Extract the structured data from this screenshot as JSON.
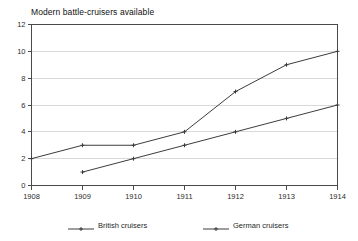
{
  "chart_data": {
    "type": "line",
    "title": "Modern battle-cruisers available",
    "xlabel": "",
    "ylabel": "",
    "x": [
      1908,
      1909,
      1910,
      1911,
      1912,
      1913,
      1914
    ],
    "xtick_labels": [
      "1908",
      "1909",
      "1910",
      "1911",
      "1912",
      "1913",
      "1914"
    ],
    "ytick_labels": [
      "0",
      "2",
      "4",
      "6",
      "8",
      "10",
      "12"
    ],
    "yticks": [
      0,
      2,
      4,
      6,
      8,
      10,
      12
    ],
    "xlim": [
      1908,
      1914
    ],
    "ylim": [
      0,
      12
    ],
    "grid": "horizontal",
    "legend_position": "bottom",
    "series": [
      {
        "name": "British cruisers",
        "color": "#3c3c3c",
        "marker": "plus",
        "x": [
          1908,
          1909,
          1910,
          1911,
          1912,
          1913,
          1914
        ],
        "values": [
          2,
          3,
          3,
          4,
          7,
          9,
          10
        ]
      },
      {
        "name": "German cruisers",
        "color": "#3c3c3c",
        "marker": "plus",
        "x": [
          1909,
          1910,
          1911,
          1912,
          1913,
          1914
        ],
        "values": [
          1,
          2,
          3,
          4,
          5,
          6
        ]
      }
    ]
  },
  "colors": {
    "gridline": "#d9d9d9",
    "axis": "#4a4a4a",
    "line": "#3c3c3c",
    "background": "#ffffff",
    "text": "#1a1a1a"
  }
}
